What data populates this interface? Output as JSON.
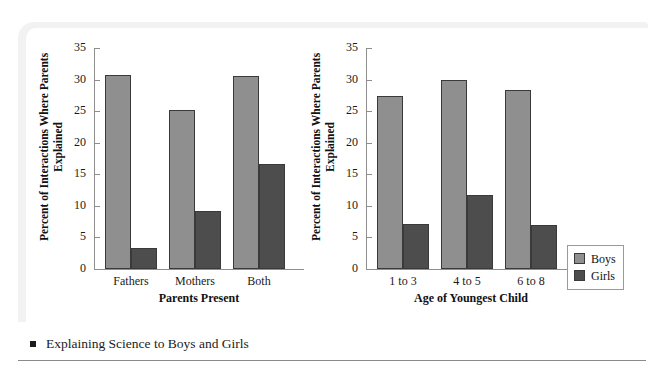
{
  "figure": {
    "caption": "Explaining Science to Boys and Girls",
    "bullet_icon": "square-bullet-icon"
  },
  "legend": {
    "items": [
      {
        "label": "Boys",
        "color": "#8f8f8f",
        "swatch_icon": "legend-swatch-boys-icon"
      },
      {
        "label": "Girls",
        "color": "#4d4d4d",
        "swatch_icon": "legend-swatch-girls-icon"
      }
    ]
  },
  "chart_data": [
    {
      "type": "bar",
      "panel": "left",
      "title": "",
      "xlabel": "Parents Present",
      "ylabel": "Percent of Interactions Where Parents Explained",
      "categories": [
        "Fathers",
        "Mothers",
        "Both"
      ],
      "series": [
        {
          "name": "Boys",
          "values": [
            30.8,
            25.2,
            30.5
          ],
          "color": "#8f8f8f"
        },
        {
          "name": "Girls",
          "values": [
            3.3,
            9.2,
            16.7
          ],
          "color": "#4d4d4d"
        }
      ],
      "ylim": [
        0,
        35
      ],
      "yticks": [
        0,
        5,
        10,
        15,
        20,
        25,
        30,
        35
      ],
      "grid": false,
      "legend_position": "outside-right"
    },
    {
      "type": "bar",
      "panel": "right",
      "title": "",
      "xlabel": "Age of Youngest Child",
      "ylabel": "Percent of Interactions Where Parents Explained",
      "categories": [
        "1 to 3",
        "4 to 5",
        "6 to 8"
      ],
      "series": [
        {
          "name": "Boys",
          "values": [
            27.4,
            30.0,
            28.4
          ],
          "color": "#8f8f8f"
        },
        {
          "name": "Girls",
          "values": [
            7.1,
            11.7,
            6.9
          ],
          "color": "#4d4d4d"
        }
      ],
      "ylim": [
        0,
        35
      ],
      "yticks": [
        0,
        5,
        10,
        15,
        20,
        25,
        30,
        35
      ],
      "grid": false,
      "legend_position": "outside-right"
    }
  ]
}
